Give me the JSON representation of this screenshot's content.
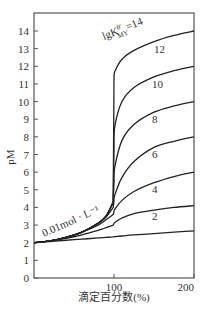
{
  "chart_data": {
    "type": "line",
    "title": "",
    "xlabel": "滴定百分数(%)",
    "ylabel": "pM",
    "xlim": [
      0,
      200
    ],
    "ylim": [
      0,
      15
    ],
    "xticks": [
      100,
      200
    ],
    "yticks": [
      0,
      1,
      2,
      3,
      4,
      5,
      6,
      7,
      8,
      9,
      10,
      11,
      12,
      13,
      14
    ],
    "grid": false,
    "annotation": "0.01mol · L⁻¹",
    "x": [
      0,
      20,
      40,
      60,
      80,
      90,
      99,
      100,
      101,
      110,
      125,
      150,
      175,
      200
    ],
    "series": [
      {
        "name": "lgK'MY=14",
        "values": [
          2.0,
          2.1,
          2.3,
          2.6,
          3.1,
          3.5,
          4.3,
          11.3,
          11.7,
          12.4,
          12.9,
          13.4,
          13.75,
          14.0
        ]
      },
      {
        "name": "12",
        "values": [
          2.0,
          2.1,
          2.3,
          2.6,
          3.1,
          3.5,
          4.3,
          7.5,
          8.6,
          10.0,
          10.8,
          11.4,
          11.75,
          12.0
        ]
      },
      {
        "name": "10",
        "values": [
          2.0,
          2.1,
          2.3,
          2.6,
          3.1,
          3.5,
          4.3,
          5.5,
          6.3,
          7.8,
          8.7,
          9.4,
          9.75,
          10.0
        ]
      },
      {
        "name": "8",
        "values": [
          2.0,
          2.1,
          2.3,
          2.6,
          3.1,
          3.45,
          4.0,
          4.4,
          4.7,
          5.7,
          6.6,
          7.4,
          7.75,
          8.0
        ]
      },
      {
        "name": "6",
        "values": [
          2.0,
          2.1,
          2.3,
          2.6,
          3.0,
          3.3,
          3.6,
          3.75,
          3.9,
          4.4,
          4.9,
          5.4,
          5.75,
          6.0
        ]
      },
      {
        "name": "4",
        "values": [
          2.0,
          2.1,
          2.25,
          2.45,
          2.7,
          2.85,
          3.0,
          3.1,
          3.15,
          3.4,
          3.65,
          3.85,
          4.0,
          4.1
        ]
      },
      {
        "name": "2",
        "values": [
          2.0,
          2.07,
          2.14,
          2.2,
          2.27,
          2.3,
          2.33,
          2.34,
          2.34,
          2.38,
          2.44,
          2.52,
          2.6,
          2.67
        ]
      }
    ],
    "curve_labels": [
      {
        "text": "lgK",
        "sub": "MY",
        "sup": "θ'",
        "tail": "=14"
      },
      {
        "text": "12"
      },
      {
        "text": "10"
      },
      {
        "text": "8"
      },
      {
        "text": "6"
      },
      {
        "text": "4"
      },
      {
        "text": "2"
      }
    ]
  }
}
